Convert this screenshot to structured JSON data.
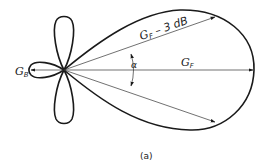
{
  "figure": {
    "caption": "(a)",
    "labels": {
      "back_gain": {
        "main": "G",
        "sub": "B"
      },
      "forward_gain": {
        "main": "G",
        "sub": "F"
      },
      "half_power": {
        "main": "G",
        "sub": "F",
        "suffix": " – 3 dB"
      },
      "beamwidth": "α"
    },
    "colors": {
      "stroke": "#1a1a1a",
      "ray": "#333333",
      "background": "#ffffff"
    },
    "elements": [
      "main-lobe",
      "back-lobe",
      "upper-side-lobe",
      "lower-side-lobe",
      "forward-gain-arrow",
      "back-gain-arrow",
      "upper-half-power-arrow",
      "lower-half-power-arrow",
      "beamwidth-angle-arc"
    ]
  }
}
